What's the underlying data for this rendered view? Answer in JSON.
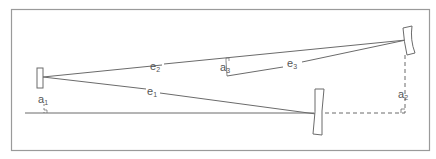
{
  "diagram": {
    "frame_color": "#9a9a9a",
    "line_color": "#6b6b6b",
    "labels": {
      "e1": {
        "base": "e",
        "sub": "1"
      },
      "e2": {
        "base": "e",
        "sub": "2"
      },
      "e3": {
        "base": "e",
        "sub": "3"
      },
      "a1": {
        "base": "a",
        "sub": "1"
      },
      "a2": {
        "base": "a",
        "sub": "2"
      },
      "a3": {
        "base": "a",
        "sub": "3"
      }
    }
  }
}
